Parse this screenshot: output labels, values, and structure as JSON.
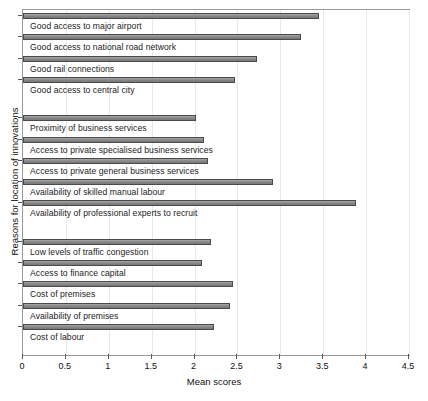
{
  "figure": {
    "top_artifact": ""
  },
  "chart_data": {
    "type": "bar",
    "orientation": "horizontal",
    "title": "",
    "xlabel": "Mean scores",
    "ylabel": "Reasons for location of innovations",
    "xlim": [
      0,
      4.5
    ],
    "xticks": [
      0,
      0.5,
      1,
      1.5,
      2,
      2.5,
      3,
      3.5,
      4,
      4.5
    ],
    "xticklabels": [
      "0",
      "0.5",
      "1",
      "1.5",
      "2",
      "2.5",
      "3",
      "3.5",
      "4",
      "4.5"
    ],
    "grid": true,
    "legend": "none",
    "bar_color": "#8e8e8e",
    "bar_edge_color": "#4a4a4a",
    "categories": [
      "Good access to major airport",
      "Good access to national road network",
      "Good rail connections",
      "Good access to central city",
      "Proximity of business services",
      "Access to private specialised business services",
      "Access to private general business services",
      "Availability of skilled manual labour",
      "Availability of professional experts to recruit",
      "Low levels of traffic congestion",
      "Access to finance capital",
      "Cost of premises",
      "Availability of premises",
      "Cost of labour"
    ],
    "values": [
      3.45,
      3.24,
      2.73,
      2.47,
      2.02,
      2.11,
      2.16,
      2.91,
      3.88,
      2.19,
      2.09,
      2.45,
      2.41,
      2.23
    ],
    "groups": [
      {
        "name": "accessibility",
        "categories": [
          0,
          1,
          2,
          3
        ]
      },
      {
        "name": "business services and labour",
        "categories": [
          4,
          5,
          6,
          7,
          8
        ]
      },
      {
        "name": "premises and costs",
        "categories": [
          9,
          10,
          11,
          12,
          13
        ]
      }
    ]
  }
}
